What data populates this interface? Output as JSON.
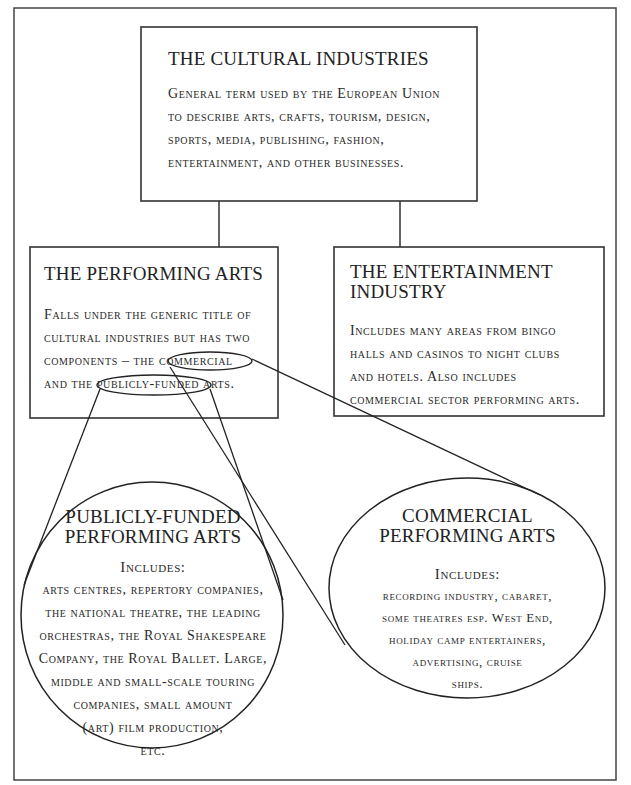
{
  "diagram": {
    "top_box": {
      "title": "THE CULTURAL INDUSTRIES",
      "lines": [
        "General term used by the European Union",
        "to describe arts, crafts, tourism, design,",
        "sports, media, publishing, fashion,",
        "entertainment, and other businesses."
      ]
    },
    "left_box": {
      "title": "THE PERFORMING ARTS",
      "line1": "Falls under the generic title of",
      "line2": "cultural industries but has two",
      "line3_prefix": "components – the ",
      "line3_highlight": "commercial",
      "line4_prefix": "and the ",
      "line4_highlight": "publicly-funded",
      "line4_suffix": " arts."
    },
    "right_box": {
      "title_line1": "THE ENTERTAINMENT",
      "title_line2": "INDUSTRY",
      "lines": [
        "Includes many areas from bingo",
        "halls and casinos to night clubs",
        "and hotels. Also includes",
        "commercial sector performing arts."
      ]
    },
    "publicly_funded_circle": {
      "title_line1": "PUBLICLY-FUNDED",
      "title_line2": "PERFORMING ARTS",
      "includes_label": "Includes:",
      "lines": [
        "arts centres, repertory companies,",
        "the national theatre, the leading",
        "orchestras, the Royal Shakespeare",
        "Company, the Royal Ballet. Large,",
        "middle and small-scale touring",
        "companies, small amount",
        "(art) film production,",
        "etc."
      ]
    },
    "commercial_ellipse": {
      "title_line1": "COMMERCIAL",
      "title_line2": "PERFORMING ARTS",
      "includes_label": "Includes:",
      "lines": [
        "recording industry, cabaret,",
        "some theatres esp. West End,",
        "holiday camp entertainers,",
        "advertising, cruise",
        "ships."
      ]
    },
    "colors": {
      "stroke": "#333333",
      "text": "#2a2a2a",
      "background": "#ffffff"
    }
  }
}
